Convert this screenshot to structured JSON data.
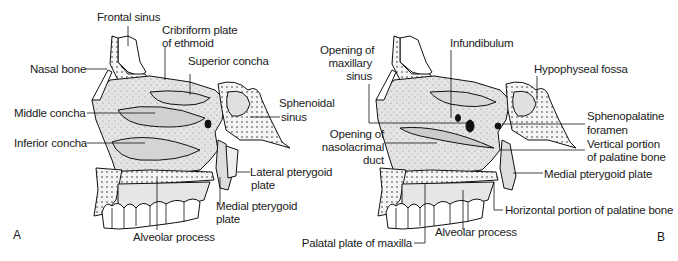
{
  "figure": {
    "panels": [
      {
        "letter": "A",
        "labels": {
          "frontal_sinus": "Frontal sinus",
          "cribriform_1": "Cribriform plate",
          "cribriform_2": "of ethmoid",
          "nasal_bone": "Nasal bone",
          "superior_concha": "Superior concha",
          "middle_concha": "Middle concha",
          "sphenoidal_1": "Sphenoidal",
          "sphenoidal_2": "sinus",
          "inferior_concha": "Inferior concha",
          "lateral_ptg_1": "Lateral pterygoid",
          "lateral_ptg_2": "plate",
          "medial_ptg_1": "Medial pterygoid",
          "medial_ptg_2": "plate",
          "alveolar": "Alveolar process"
        }
      },
      {
        "letter": "B",
        "labels": {
          "opening_max_1": "Opening of",
          "opening_max_2": "maxillary",
          "opening_max_3": "sinus",
          "infundibulum": "Infundibulum",
          "hypophyseal": "Hypophyseal fossa",
          "opening_naso_1": "Opening of",
          "opening_naso_2": "nasolacrimal",
          "opening_naso_3": "duct",
          "sphenopalatine_1": "Sphenopalatine",
          "sphenopalatine_2": "foramen",
          "vertical_pal_1": "Vertical portion",
          "vertical_pal_2": "of palatine bone",
          "medial_ptg": "Medial pterygoid plate",
          "horizontal_pal": "Horizontal portion of palatine bone",
          "alveolar": "Alveolar process",
          "palatal_plate": "Palatal plate of maxilla"
        }
      }
    ]
  }
}
